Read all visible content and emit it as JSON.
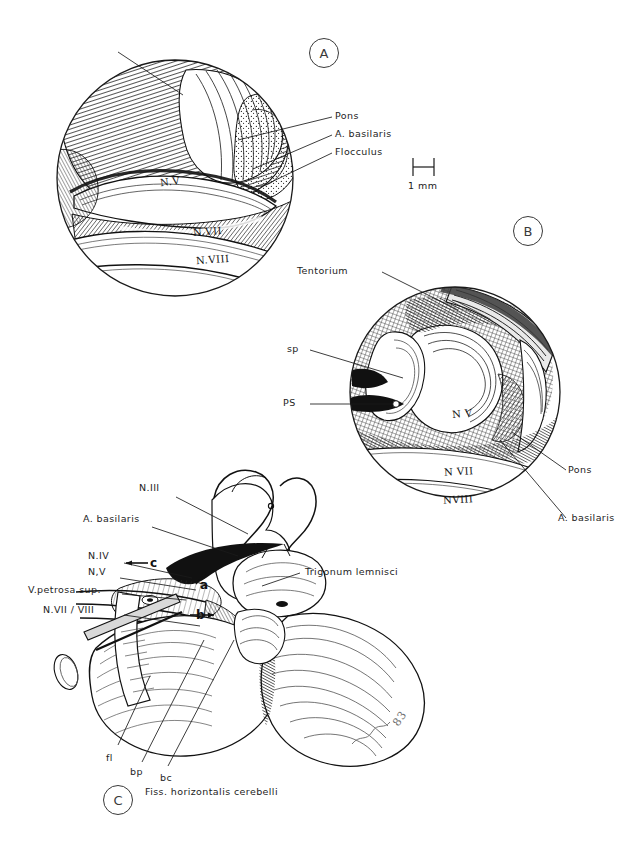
{
  "figure": {
    "kind": "anatomical-line-drawing",
    "background": "#ffffff",
    "ink": "#1a1a1a",
    "signature": "83"
  },
  "panels": [
    {
      "id": "A",
      "mark": "A"
    },
    {
      "id": "B",
      "mark": "B"
    },
    {
      "id": "C",
      "mark": "C"
    }
  ],
  "scale_bar": {
    "caption": "1 mm"
  },
  "panel_a": {
    "leader_labels": [
      {
        "text": "Pons"
      },
      {
        "text": "A. basilaris"
      },
      {
        "text": "Flocculus"
      }
    ],
    "inner_labels": [
      {
        "text": "N.V"
      },
      {
        "text": "N.VII"
      },
      {
        "text": "N.VIII"
      }
    ]
  },
  "panel_b": {
    "leader_labels": [
      {
        "text": "Tentorium"
      },
      {
        "text": "sp"
      },
      {
        "text": "PS"
      },
      {
        "text": "Pons"
      },
      {
        "text": "A. basilaris"
      }
    ],
    "inner_labels": [
      {
        "text": "N V"
      },
      {
        "text": "N VII"
      },
      {
        "text": "NVIII"
      }
    ]
  },
  "panel_c": {
    "left_labels": [
      {
        "text": "N.III"
      },
      {
        "text": "A. basilaris"
      },
      {
        "text": "N.IV"
      },
      {
        "text": "N,V"
      },
      {
        "text": "V.petrosa sup."
      },
      {
        "text": "N.VII / VIII"
      }
    ],
    "right_labels": [
      {
        "text": "Trigonum lemnisci"
      }
    ],
    "bottom_labels": [
      {
        "text": "fl"
      },
      {
        "text": "bp"
      },
      {
        "text": "bc"
      },
      {
        "text": "Fiss. horizontalis cerebelli"
      }
    ],
    "arrow_marks": [
      {
        "text": "c"
      },
      {
        "text": "a"
      },
      {
        "text": "b"
      }
    ]
  }
}
